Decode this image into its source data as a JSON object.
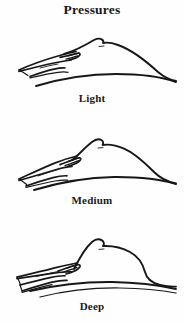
{
  "figure": {
    "title": "Pressures",
    "kind": "line-drawing-diagram",
    "background_color": "#fefefe",
    "ink_color": "#171717",
    "panels": [
      {
        "id": "light",
        "label": "Light",
        "order": 1,
        "description": "Flat extended hand rests on the surface; mound contour is low and broad with only slight indentation where the fingers contact it.",
        "hand_angle": "shallow",
        "indentation": "minimal",
        "mound_height": "low",
        "apex_marker": "small nipple bump at crest"
      },
      {
        "id": "medium",
        "label": "Medium",
        "order": 2,
        "description": "Hand angled downward presses further in; the mound rises higher and its left flank is visibly displaced by the fingertips.",
        "hand_angle": "moderate",
        "indentation": "moderate",
        "mound_height": "medium",
        "apex_marker": "small nipple bump at crest"
      },
      {
        "id": "deep",
        "label": "Deep",
        "order": 3,
        "description": "Fingers sink deepest; the mound is compressed into a tall steep-sided dome and the underlying base curve is pushed down.",
        "hand_angle": "steep",
        "indentation": "deep",
        "mound_height": "high",
        "apex_marker": "small nipple bump at crest"
      }
    ]
  }
}
